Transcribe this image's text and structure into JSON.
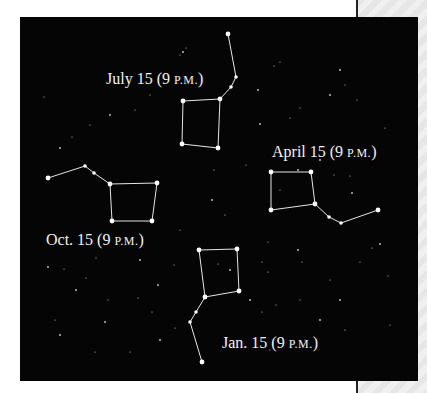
{
  "figure": {
    "background_color": "#050505",
    "star_color": "#ffffff",
    "line_color": "#e6e6e6"
  },
  "labels": [
    {
      "id": "july",
      "date": "July 15",
      "time_open": "(9 ",
      "time_sc": "P.M.",
      "time_close": ")",
      "x": 106,
      "y": 70
    },
    {
      "id": "april",
      "date": "April 15",
      "time_open": "(9 ",
      "time_sc": "P.M.",
      "time_close": ")",
      "x": 272,
      "y": 143
    },
    {
      "id": "oct",
      "date": "Oct. 15",
      "time_open": "(9 ",
      "time_sc": "P.M.",
      "time_close": ")",
      "x": 46,
      "y": 231
    },
    {
      "id": "jan",
      "date": "Jan. 15",
      "time_open": "(9 ",
      "time_sc": "P.M.",
      "time_close": ")",
      "x": 222,
      "y": 334
    }
  ],
  "constellations": [
    {
      "id": "july",
      "stars": [
        [
          228,
          34
        ],
        [
          236,
          77
        ],
        [
          231,
          87
        ],
        [
          220,
          99
        ],
        [
          183,
          101
        ],
        [
          182,
          144
        ],
        [
          218,
          148
        ]
      ],
      "edges": [
        [
          0,
          1
        ],
        [
          1,
          2
        ],
        [
          2,
          3
        ],
        [
          3,
          4
        ],
        [
          4,
          5
        ],
        [
          5,
          6
        ],
        [
          6,
          3
        ]
      ]
    },
    {
      "id": "oct",
      "stars": [
        [
          48,
          178
        ],
        [
          85,
          166
        ],
        [
          94,
          173
        ],
        [
          110,
          184
        ],
        [
          157,
          183
        ],
        [
          152,
          221
        ],
        [
          112,
          221
        ]
      ],
      "edges": [
        [
          0,
          1
        ],
        [
          1,
          2
        ],
        [
          2,
          3
        ],
        [
          3,
          4
        ],
        [
          4,
          5
        ],
        [
          5,
          6
        ],
        [
          6,
          3
        ]
      ]
    },
    {
      "id": "april",
      "stars": [
        [
          378,
          210
        ],
        [
          341,
          223
        ],
        [
          329,
          217
        ],
        [
          315,
          204
        ],
        [
          311,
          172
        ],
        [
          271,
          172
        ],
        [
          271,
          210
        ]
      ],
      "edges": [
        [
          0,
          1
        ],
        [
          1,
          2
        ],
        [
          2,
          3
        ],
        [
          3,
          4
        ],
        [
          4,
          5
        ],
        [
          5,
          6
        ],
        [
          6,
          3
        ]
      ]
    },
    {
      "id": "jan",
      "stars": [
        [
          202,
          362
        ],
        [
          190,
          322
        ],
        [
          196,
          312
        ],
        [
          205,
          297
        ],
        [
          199,
          250
        ],
        [
          237,
          249
        ],
        [
          239,
          291
        ]
      ],
      "edges": [
        [
          0,
          1
        ],
        [
          1,
          2
        ],
        [
          2,
          3
        ],
        [
          3,
          4
        ],
        [
          4,
          5
        ],
        [
          5,
          6
        ],
        [
          6,
          3
        ]
      ]
    }
  ],
  "background_stars": [
    [
      183,
      52
    ],
    [
      186,
      48
    ],
    [
      180,
      55
    ],
    [
      258,
      90
    ],
    [
      274,
      66
    ],
    [
      280,
      62
    ],
    [
      340,
      70
    ],
    [
      357,
      100
    ],
    [
      44,
      97
    ],
    [
      60,
      148
    ],
    [
      72,
      137
    ],
    [
      90,
      125
    ],
    [
      110,
      115
    ],
    [
      135,
      110
    ],
    [
      150,
      95
    ],
    [
      260,
      124
    ],
    [
      290,
      118
    ],
    [
      300,
      108
    ],
    [
      330,
      95
    ],
    [
      345,
      85
    ],
    [
      385,
      128
    ],
    [
      320,
      160
    ],
    [
      246,
      165
    ],
    [
      214,
      170
    ],
    [
      212,
      200
    ],
    [
      225,
      215
    ],
    [
      180,
      230
    ],
    [
      140,
      260
    ],
    [
      96,
      258
    ],
    [
      64,
      269
    ],
    [
      48,
      267
    ],
    [
      86,
      278
    ],
    [
      108,
      300
    ],
    [
      76,
      290
    ],
    [
      138,
      298
    ],
    [
      152,
      312
    ],
    [
      105,
      322
    ],
    [
      262,
      262
    ],
    [
      268,
      272
    ],
    [
      298,
      250
    ],
    [
      302,
      262
    ],
    [
      330,
      280
    ],
    [
      340,
      300
    ],
    [
      360,
      262
    ],
    [
      372,
      248
    ],
    [
      380,
      244
    ],
    [
      388,
      276
    ],
    [
      300,
      300
    ],
    [
      320,
      320
    ],
    [
      345,
      330
    ],
    [
      390,
      325
    ],
    [
      250,
      300
    ],
    [
      262,
      312
    ],
    [
      276,
      305
    ],
    [
      230,
      270
    ],
    [
      218,
      264
    ],
    [
      55,
      320
    ],
    [
      60,
      335
    ],
    [
      95,
      352
    ],
    [
      130,
      352
    ],
    [
      160,
      340
    ],
    [
      175,
      328
    ],
    [
      280,
      190
    ],
    [
      298,
      170
    ],
    [
      334,
      175
    ],
    [
      350,
      176
    ],
    [
      352,
      193
    ],
    [
      268,
      242
    ],
    [
      174,
      265
    ],
    [
      158,
      285
    ],
    [
      305,
      340
    ],
    [
      270,
      350
    ]
  ]
}
